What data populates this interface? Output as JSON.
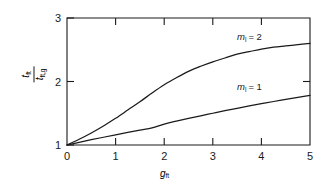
{
  "chart_data": {
    "type": "line",
    "title": "",
    "xlabel": "g_ft",
    "ylabel": "t_ft / t_ft,g",
    "xlim": [
      0,
      5
    ],
    "ylim": [
      1,
      3
    ],
    "xticks": [
      0,
      1,
      2,
      3,
      4,
      5
    ],
    "yticks": [
      1,
      2,
      3
    ],
    "grid": false,
    "legend": "inline-annotations",
    "series": [
      {
        "name": "m_l = 2",
        "label": "m",
        "label_sub": "l",
        "label_eq": "= 2",
        "x": [
          0,
          0.25,
          0.5,
          0.75,
          1.0,
          1.25,
          1.5,
          1.75,
          2.0,
          2.25,
          2.5,
          2.75,
          3.0,
          3.25,
          3.5,
          3.75,
          4.0,
          4.25,
          4.5,
          4.75,
          5.0
        ],
        "values": [
          1.0,
          1.09,
          1.19,
          1.3,
          1.42,
          1.55,
          1.68,
          1.82,
          1.95,
          2.06,
          2.16,
          2.24,
          2.31,
          2.37,
          2.43,
          2.47,
          2.51,
          2.54,
          2.56,
          2.58,
          2.6
        ]
      },
      {
        "name": "m_l = 1",
        "label": "m",
        "label_sub": "l",
        "label_eq": "= 1",
        "x": [
          0,
          0.25,
          0.5,
          0.75,
          1.0,
          1.25,
          1.5,
          1.75,
          2.0,
          2.25,
          2.5,
          2.75,
          3.0,
          3.25,
          3.5,
          3.75,
          4.0,
          4.25,
          4.5,
          4.75,
          5.0
        ],
        "values": [
          1.0,
          1.042,
          1.083,
          1.122,
          1.16,
          1.198,
          1.235,
          1.27,
          1.33,
          1.375,
          1.418,
          1.46,
          1.5,
          1.54,
          1.578,
          1.615,
          1.65,
          1.685,
          1.717,
          1.749,
          1.78
        ]
      }
    ],
    "annotations": [
      {
        "text_main": "m",
        "text_sub": "l",
        "text_tail": "= 2",
        "x": 3.6,
        "y": 2.72
      },
      {
        "text_main": "m",
        "text_sub": "l",
        "text_tail": "= 1",
        "x": 3.6,
        "y": 1.93
      }
    ]
  },
  "axes": {
    "y_label_num_main": "t",
    "y_label_num_sub": "ft",
    "y_label_den_main": "t",
    "y_label_den_sub": "ft,g",
    "x_label_main": "g",
    "x_label_sub": "ft",
    "x_tick_labels": [
      "0",
      "1",
      "2",
      "3",
      "4",
      "5"
    ],
    "y_tick_labels": [
      "1",
      "2",
      "3"
    ]
  },
  "style": {
    "line_color": "#1a1a1a",
    "axis_color": "#1a1a1a",
    "background": "#ffffff"
  }
}
